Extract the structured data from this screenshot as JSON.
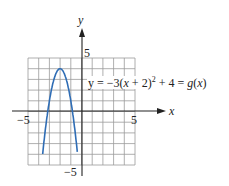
{
  "chart_data": {
    "type": "line",
    "title": "",
    "xlabel": "x",
    "ylabel": "y",
    "xlim": [
      -5,
      5
    ],
    "ylim": [
      -5,
      5
    ],
    "grid": true,
    "x_ticks_labeled": [
      "-5",
      "5"
    ],
    "y_ticks_labeled": [
      "5",
      "-5"
    ],
    "series": [
      {
        "name": "y = -3(x + 2)^2 + 4 = g(x)",
        "color": "#2f6db5",
        "x": [
          -3.6,
          -3.5,
          -3.0,
          -2.5,
          -2.0,
          -1.5,
          -1.0,
          -0.5,
          -0.4
        ],
        "y": [
          -3.68,
          -2.75,
          1.0,
          3.25,
          4.0,
          3.25,
          1.0,
          -2.75,
          -3.68
        ]
      }
    ],
    "annotations": [
      "y = −3(x + 2)² + 4 = g(x)"
    ]
  },
  "labels": {
    "x_axis": "x",
    "y_axis": "y",
    "tick_x_neg": "−5",
    "tick_x_pos": "5",
    "tick_y_pos": "5",
    "tick_y_neg": "−5",
    "equation_pre": "y = −3(",
    "equation_x": "x",
    "equation_mid": " + 2)",
    "equation_sup": "2",
    "equation_post": " + 4 = ",
    "equation_g": "g",
    "equation_paren": "(",
    "equation_x2": "x",
    "equation_end": ")"
  }
}
